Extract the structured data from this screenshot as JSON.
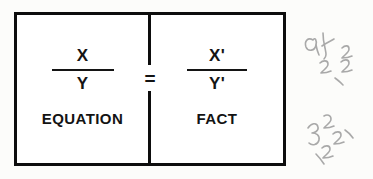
{
  "document": {
    "kind": "scanned-diagram",
    "background_color": "#fcfcfa",
    "ink_color": "#0d0d0d"
  },
  "figure": {
    "border_color": "#0d0d0d",
    "relation_symbol": "=",
    "panels": [
      {
        "id": "equation-panel",
        "side": "left",
        "fraction": {
          "numerator": "X",
          "denominator": "Y"
        },
        "caption": "EQUATION"
      },
      {
        "id": "fact-panel",
        "side": "right",
        "fraction": {
          "numerator": "X'",
          "denominator": "Y'"
        },
        "caption": "FACT"
      }
    ]
  },
  "margin_annotations": {
    "color": "#a9a9a9",
    "items": [
      {
        "id": "handwriting-top",
        "description": "faint handwritten pencil scribble, illegible"
      },
      {
        "id": "handwriting-bottom",
        "description": "faint handwritten pencil scribble, illegible"
      }
    ]
  }
}
